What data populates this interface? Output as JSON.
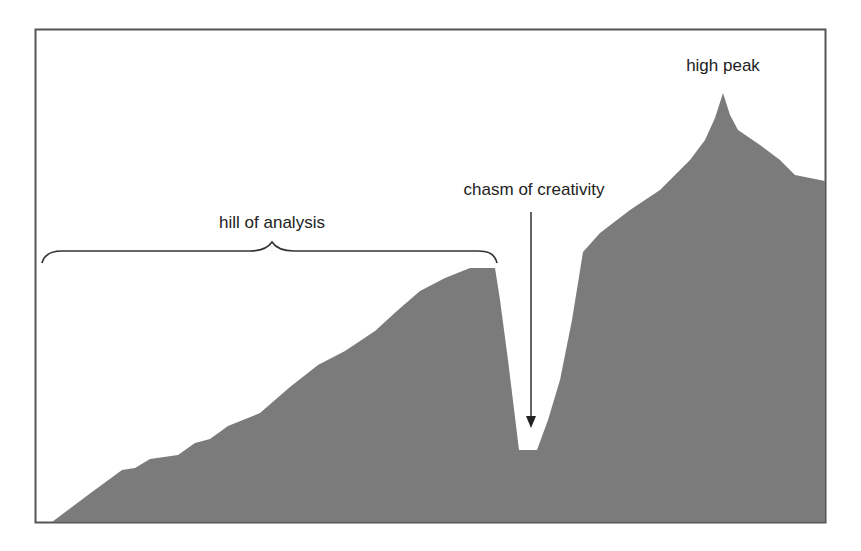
{
  "figure": {
    "frame_color": "#555555",
    "mountain_color": "#7b7b7b",
    "background": "#ffffff"
  },
  "labels": {
    "high_peak": "high peak",
    "chasm": "chasm of creativity",
    "hill": "hill of analysis"
  },
  "annotations": [
    {
      "type": "brace",
      "text": "hill of analysis",
      "span_x": [
        42,
        497
      ],
      "y": 253
    },
    {
      "type": "arrow",
      "text": "chasm of creativity",
      "from": [
        531,
        212
      ],
      "to": [
        531,
        428
      ]
    },
    {
      "type": "label",
      "text": "high peak",
      "at": [
        723,
        80
      ]
    }
  ]
}
